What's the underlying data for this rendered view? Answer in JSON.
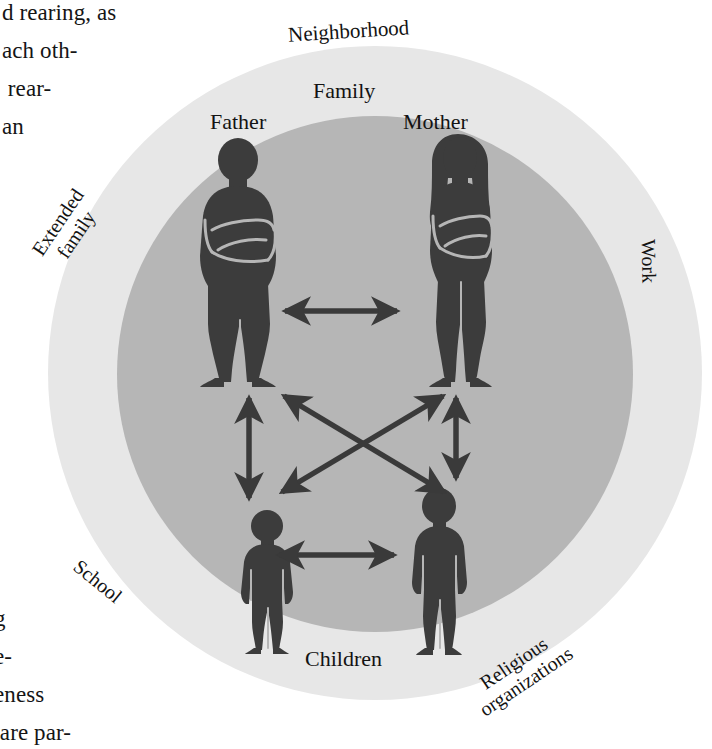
{
  "page": {
    "background_color": "#ffffff",
    "body_text_fragments": {
      "top": "d rearing, as\nach oth-\n rear-\nan",
      "bottom": "g\ne-\neness\n are par-"
    }
  },
  "diagram": {
    "type": "concentric-circle-ecological-systems",
    "colors": {
      "outer_ring": "#e7e7e7",
      "inner_circle": "#b6b6b6",
      "figure": "#3c3c3c",
      "arrow": "#3a3a3a",
      "text": "#131313"
    },
    "outer_ring_labels": [
      {
        "id": "neighborhood",
        "label": "Neighborhood",
        "position": "top",
        "rotation_deg": -3.5
      },
      {
        "id": "extended-family",
        "label": "Extended\nfamily",
        "position": "left",
        "rotation_deg": -56
      },
      {
        "id": "work",
        "label": "Work",
        "position": "right",
        "rotation_deg": 89
      },
      {
        "id": "school",
        "label": "School",
        "position": "bottom-left",
        "rotation_deg": 39
      },
      {
        "id": "religious-organizations",
        "label": "Religious\norganizations",
        "position": "bottom-right",
        "rotation_deg": -34
      }
    ],
    "inner_circle_label": "Family",
    "figures": [
      {
        "id": "father",
        "label": "Father",
        "kind": "adult",
        "pose": "arms-crossed"
      },
      {
        "id": "mother",
        "label": "Mother",
        "kind": "adult",
        "pose": "arms-crossed"
      },
      {
        "id": "child-left",
        "label": "",
        "kind": "child",
        "pose": "arms-down"
      },
      {
        "id": "child-right",
        "label": "",
        "kind": "child",
        "pose": "arms-down"
      }
    ],
    "children_label": "Children",
    "relationships": [
      {
        "from": "father",
        "to": "mother",
        "style": "double-headed-arrow"
      },
      {
        "from": "father",
        "to": "child-left",
        "style": "double-headed-arrow"
      },
      {
        "from": "mother",
        "to": "child-right",
        "style": "double-headed-arrow"
      },
      {
        "from": "father",
        "to": "child-right",
        "style": "double-headed-arrow"
      },
      {
        "from": "mother",
        "to": "child-left",
        "style": "double-headed-arrow"
      },
      {
        "from": "child-left",
        "to": "child-right",
        "style": "double-headed-arrow"
      }
    ]
  }
}
